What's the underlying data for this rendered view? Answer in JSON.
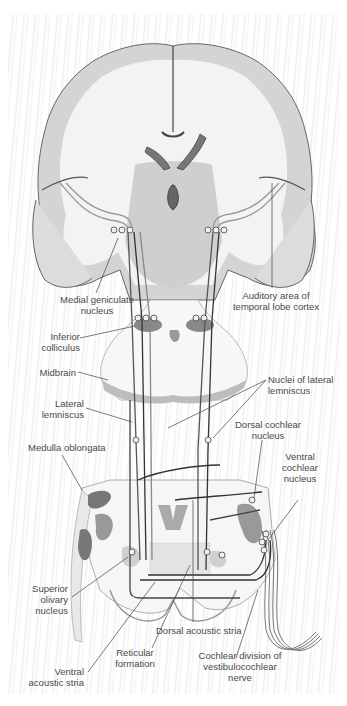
{
  "diagram": {
    "labels": {
      "medial_geniculate": [
        "Medial geniculate",
        "nucleus"
      ],
      "auditory_cortex": [
        "Auditory area of",
        "temporal lobe cortex"
      ],
      "inferior_colliculus": [
        "Inferior",
        "colliculus"
      ],
      "midbrain": [
        "Midbrain"
      ],
      "nuclei_lateral_lemniscus": [
        "Nuclei of lateral",
        "lemniscus"
      ],
      "lateral_lemniscus": [
        "Lateral",
        "lemniscus"
      ],
      "dorsal_cochlear": [
        "Dorsal cochlear",
        "nucleus"
      ],
      "medulla": [
        "Medulla oblongata"
      ],
      "ventral_cochlear": [
        "Ventral",
        "cochlear",
        "nucleus"
      ],
      "superior_olivary": [
        "Superior",
        "olivary",
        "nucleus"
      ],
      "dorsal_acoustic_stria": [
        "Dorsal acoustic stria"
      ],
      "reticular_formation": [
        "Reticular",
        "formation"
      ],
      "cochlear_division": [
        "Cochlear division of",
        "vestibulocochlear",
        "nerve"
      ],
      "ventral_acoustic_stria": [
        "Ventral",
        "acoustic stria"
      ]
    },
    "colors": {
      "brain_gray": "#c9c9c9",
      "brain_white": "#f2f2f2",
      "outline": "#555555",
      "pathway": "#3a3a3a",
      "label": "#4a4a4a"
    }
  }
}
